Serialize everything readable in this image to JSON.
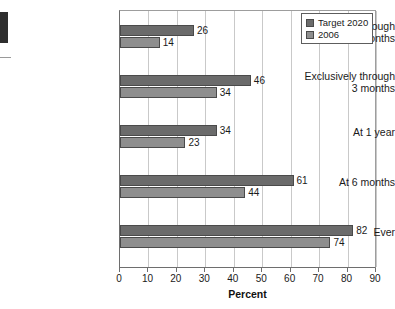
{
  "chart_data": {
    "type": "bar",
    "orientation": "horizontal",
    "title": "",
    "xlabel": "Percent",
    "ylabel": "",
    "xlim": [
      0,
      90
    ],
    "xticks": [
      0,
      10,
      20,
      30,
      40,
      50,
      60,
      70,
      80,
      90
    ],
    "grid": "vertical",
    "legend_position": "top-right",
    "categories": [
      "Exclusively through\n6 months",
      "Exclusively through\n3 months",
      "At 1 year",
      "At 6 months",
      "Ever"
    ],
    "series": [
      {
        "name": "Target 2020",
        "color": "#6b6b6b",
        "values": [
          26,
          46,
          34,
          61,
          82
        ]
      },
      {
        "name": "2006",
        "color": "#8e8e8e",
        "values": [
          14,
          34,
          23,
          44,
          74
        ]
      }
    ]
  },
  "legend": {
    "items": [
      {
        "label": "Target 2020",
        "color": "#6b6b6b"
      },
      {
        "label": "2006",
        "color": "#8e8e8e"
      }
    ]
  },
  "axis": {
    "x_title": "Percent",
    "tick_labels": [
      "0",
      "10",
      "20",
      "30",
      "40",
      "50",
      "60",
      "70",
      "80",
      "90"
    ]
  }
}
